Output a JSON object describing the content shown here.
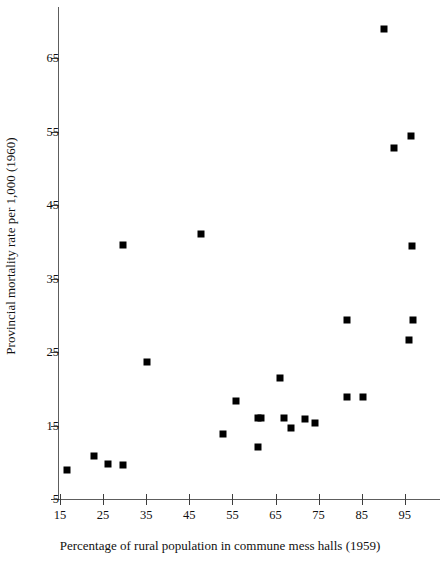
{
  "chart_data": {
    "type": "scatter",
    "title": "",
    "xlabel": "Percentage of rural population in commune mess halls (1959)",
    "ylabel": "Provincial mortality rate per 1,000 (1960)",
    "xlim": [
      12,
      100
    ],
    "ylim": [
      5,
      72
    ],
    "xticks": [
      15,
      25,
      35,
      45,
      55,
      65,
      75,
      85,
      95
    ],
    "yticks": [
      5,
      15,
      25,
      35,
      45,
      55,
      65
    ],
    "grid": false,
    "legend": null,
    "marker": "filled-square",
    "marker_color": "#000000",
    "points": [
      {
        "x": 16.6,
        "y": 8.9
      },
      {
        "x": 22.9,
        "y": 10.8
      },
      {
        "x": 26.2,
        "y": 9.8
      },
      {
        "x": 29.6,
        "y": 9.6
      },
      {
        "x": 29.7,
        "y": 39.5
      },
      {
        "x": 35.2,
        "y": 23.7
      },
      {
        "x": 47.7,
        "y": 41.0
      },
      {
        "x": 52.8,
        "y": 13.8
      },
      {
        "x": 55.8,
        "y": 18.4
      },
      {
        "x": 60.9,
        "y": 12.1
      },
      {
        "x": 61.0,
        "y": 16.0
      },
      {
        "x": 61.6,
        "y": 16.0
      },
      {
        "x": 66.1,
        "y": 21.5
      },
      {
        "x": 67.0,
        "y": 16.0
      },
      {
        "x": 68.6,
        "y": 14.7
      },
      {
        "x": 71.8,
        "y": 15.9
      },
      {
        "x": 74.1,
        "y": 15.3
      },
      {
        "x": 81.5,
        "y": 29.4
      },
      {
        "x": 81.7,
        "y": 18.9
      },
      {
        "x": 85.3,
        "y": 18.9
      },
      {
        "x": 90.2,
        "y": 69.0
      },
      {
        "x": 92.5,
        "y": 52.8
      },
      {
        "x": 96.4,
        "y": 54.4
      },
      {
        "x": 96.7,
        "y": 39.4
      },
      {
        "x": 96.8,
        "y": 29.4
      },
      {
        "x": 96.0,
        "y": 26.6
      }
    ]
  },
  "axes": {
    "x_tick_labels": [
      "15",
      "25",
      "35",
      "45",
      "55",
      "65",
      "75",
      "85",
      "95"
    ],
    "y_tick_labels": [
      "5",
      "15",
      "25",
      "35",
      "45",
      "55",
      "65"
    ]
  }
}
